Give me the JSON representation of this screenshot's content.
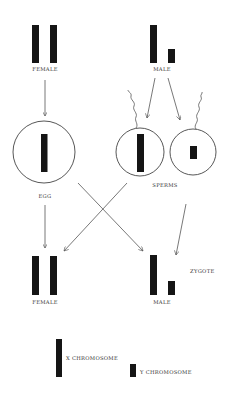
{
  "diagram": {
    "parents": {
      "female": {
        "label": "FEMALE",
        "chromosomes": [
          "X",
          "X"
        ]
      },
      "male": {
        "label": "MALE",
        "chromosomes": [
          "X",
          "Y"
        ]
      }
    },
    "gametes": {
      "egg": {
        "label": "EGG",
        "chromosome": "X"
      },
      "sperms": {
        "label": "SPERMS",
        "items": [
          {
            "chromosome": "X"
          },
          {
            "chromosome": "Y"
          }
        ]
      }
    },
    "zygote": {
      "label": "ZYGOTE",
      "female": {
        "label": "FEMALE",
        "chromosomes": [
          "X",
          "X"
        ]
      },
      "male": {
        "label": "MALE",
        "chromosomes": [
          "X",
          "Y"
        ]
      }
    },
    "legend": {
      "x": {
        "label": "X CHROMOSOME"
      },
      "y": {
        "label": "Y CHROMOSOME"
      }
    },
    "colors": {
      "chromosome": "#151515",
      "line": "#555555",
      "background": "#ffffff"
    }
  }
}
